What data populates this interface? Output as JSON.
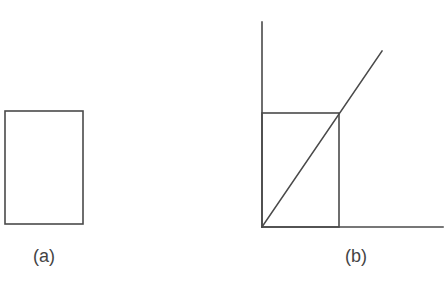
{
  "figure": {
    "panels": [
      {
        "id": "a",
        "label": "(a)",
        "description": "Standalone rectangle",
        "rect": {
          "x1": 5,
          "y1": 111,
          "x2": 83,
          "y2": 224
        }
      },
      {
        "id": "b",
        "label": "(b)",
        "description": "Rectangle placed at origin of axes, with diagonal line through origin passing through its top-right corner",
        "axes": {
          "origin": {
            "x": 262,
            "y": 227
          },
          "y_axis_top": {
            "x": 262,
            "y": 22
          },
          "x_axis_right": {
            "x": 443,
            "y": 227
          }
        },
        "rect": {
          "x1": 262,
          "y1": 113,
          "x2": 339,
          "y2": 227
        },
        "diagonal": {
          "x1": 262,
          "y1": 227,
          "x2": 382,
          "y2": 51
        }
      }
    ],
    "colors": {
      "line": "#4a4a4a",
      "text": "#444444",
      "background": "#ffffff"
    }
  }
}
